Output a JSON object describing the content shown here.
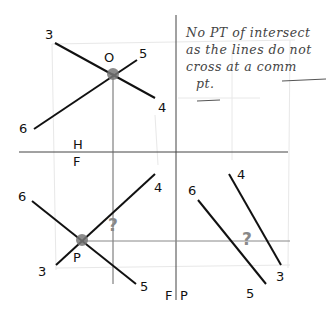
{
  "diagram": {
    "top_view": {
      "point_label": "O",
      "line_a": {
        "start_label": "3",
        "end_label": "4"
      },
      "line_b": {
        "start_label": "6",
        "end_label": "5"
      }
    },
    "fold_line_hf": {
      "upper": "H",
      "lower": "F"
    },
    "fold_line_fp": {
      "left": "F",
      "right": "P"
    },
    "front_view": {
      "point_label": "P",
      "line_a": {
        "start_label": "6",
        "end_label": "5"
      },
      "line_b": {
        "start_label": "3",
        "end_label": "4"
      },
      "unknown_mark": "?"
    },
    "profile_view": {
      "line_a": {
        "start_label": "4",
        "end_label": "3"
      },
      "line_b": {
        "start_label": "6",
        "end_label": "5"
      },
      "unknown_mark": "?"
    },
    "note": {
      "lines": [
        "No  PT  of intersect",
        "as  the lines do  not",
        "cross   at a  comm",
        "pt."
      ]
    },
    "colors": {
      "ink": "#111111",
      "construction": "#555555",
      "intersection_dot": "#777777",
      "question_mark": "#888888",
      "faint_grid": "#e6e6e6"
    }
  }
}
